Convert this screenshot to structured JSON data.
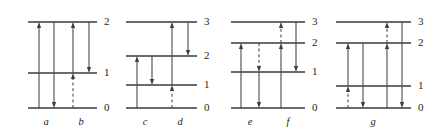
{
  "figure": {
    "type": "energy-level-diagram",
    "width": 438,
    "height": 140,
    "background_color": "#ffffff",
    "line_color": "#3a3a3a",
    "arrow_color": "#4a4a4a",
    "text_color": "#1c1c1c"
  },
  "panels": [
    {
      "id": "panel-1",
      "x_start": 28,
      "x_end": 97,
      "label_y": 123,
      "levels": [
        {
          "name": "2",
          "y": 22,
          "x_start": 28,
          "x_end": 97
        },
        {
          "name": "1",
          "y": 73,
          "x_start": 28,
          "x_end": 97
        },
        {
          "name": "0",
          "y": 108,
          "x_start": 28,
          "x_end": 97
        }
      ],
      "level_label_x": 104,
      "columns": [
        {
          "name": "a",
          "x": 46
        },
        {
          "name": "b",
          "x": 81
        }
      ],
      "arrows": [
        {
          "name": "arrow-up-0-to-2",
          "x": 39,
          "y_from": 108,
          "y_to": 22,
          "direction": "up",
          "style": "solid"
        },
        {
          "name": "arrow-down-2-to-0",
          "x": 54,
          "y_from": 22,
          "y_to": 108,
          "direction": "down",
          "style": "solid"
        },
        {
          "name": "arrow-up-0-to-1-dashed",
          "x": 73,
          "y_from": 108,
          "y_to": 73,
          "direction": "up",
          "style": "dashed"
        },
        {
          "name": "arrow-up-1-to-2",
          "x": 73,
          "y_from": 73,
          "y_to": 22,
          "direction": "up",
          "style": "solid"
        },
        {
          "name": "arrow-down-2-to-1",
          "x": 89,
          "y_from": 22,
          "y_to": 73,
          "direction": "down",
          "style": "solid"
        }
      ]
    },
    {
      "id": "panel-2",
      "x_start": 126,
      "x_end": 197,
      "label_y": 123,
      "levels": [
        {
          "name": "3",
          "y": 22,
          "x_start": 126,
          "x_end": 197
        },
        {
          "name": "2",
          "y": 56,
          "x_start": 126,
          "x_end": 197
        },
        {
          "name": "1",
          "y": 85,
          "x_start": 126,
          "x_end": 197
        },
        {
          "name": "0",
          "y": 108,
          "x_start": 126,
          "x_end": 197
        }
      ],
      "level_label_x": 204,
      "columns": [
        {
          "name": "c",
          "x": 145
        },
        {
          "name": "d",
          "x": 180
        }
      ],
      "arrows": [
        {
          "name": "arrow-up-0-to-2",
          "x": 137,
          "y_from": 108,
          "y_to": 56,
          "direction": "up",
          "style": "solid"
        },
        {
          "name": "arrow-down-2-to-1",
          "x": 152,
          "y_from": 56,
          "y_to": 85,
          "direction": "down",
          "style": "solid"
        },
        {
          "name": "arrow-up-0-to-1-dashed",
          "x": 172,
          "y_from": 108,
          "y_to": 85,
          "direction": "up",
          "style": "dashed"
        },
        {
          "name": "arrow-up-1-to-3",
          "x": 172,
          "y_from": 85,
          "y_to": 22,
          "direction": "up",
          "style": "solid"
        },
        {
          "name": "arrow-down-3-to-2",
          "x": 188,
          "y_from": 22,
          "y_to": 56,
          "direction": "down",
          "style": "solid"
        }
      ]
    },
    {
      "id": "panel-3",
      "x_start": 231,
      "x_end": 305,
      "label_y": 123,
      "levels": [
        {
          "name": "3",
          "y": 22,
          "x_start": 231,
          "x_end": 305
        },
        {
          "name": "2",
          "y": 43,
          "x_start": 231,
          "x_end": 305
        },
        {
          "name": "1",
          "y": 72,
          "x_start": 231,
          "x_end": 305
        },
        {
          "name": "0",
          "y": 108,
          "x_start": 231,
          "x_end": 305
        }
      ],
      "level_label_x": 312,
      "columns": [
        {
          "name": "e",
          "x": 250
        },
        {
          "name": "f",
          "x": 288
        }
      ],
      "arrows": [
        {
          "name": "arrow-up-1-to-2",
          "x": 241,
          "y_from": 108,
          "y_to": 43,
          "direction": "up",
          "style": "solid"
        },
        {
          "name": "arrow-down-2-to-1-dashed",
          "x": 259,
          "y_from": 43,
          "y_to": 72,
          "direction": "down",
          "style": "dashed"
        },
        {
          "name": "arrow-down-1-to-0",
          "x": 259,
          "y_from": 72,
          "y_to": 108,
          "direction": "down",
          "style": "solid"
        },
        {
          "name": "arrow-up-0-to-2",
          "x": 281,
          "y_from": 108,
          "y_to": 43,
          "direction": "up",
          "style": "solid"
        },
        {
          "name": "arrow-up-2-to-3-dashed",
          "x": 281,
          "y_from": 43,
          "y_to": 22,
          "direction": "up",
          "style": "dashed"
        },
        {
          "name": "arrow-down-3-to-1",
          "x": 296,
          "y_from": 22,
          "y_to": 72,
          "direction": "down",
          "style": "solid"
        }
      ]
    },
    {
      "id": "panel-4",
      "x_start": 336,
      "x_end": 411,
      "label_y": 123,
      "levels": [
        {
          "name": "3",
          "y": 22,
          "x_start": 336,
          "x_end": 411
        },
        {
          "name": "2",
          "y": 43,
          "x_start": 336,
          "x_end": 411
        },
        {
          "name": "1",
          "y": 86,
          "x_start": 336,
          "x_end": 411
        },
        {
          "name": "0",
          "y": 108,
          "x_start": 336,
          "x_end": 411
        }
      ],
      "level_label_x": 418,
      "columns": [
        {
          "name": "g",
          "x": 373
        }
      ],
      "arrows": [
        {
          "name": "arrow-up-0-to-1-dashed",
          "x": 348,
          "y_from": 108,
          "y_to": 86,
          "direction": "up",
          "style": "dashed"
        },
        {
          "name": "arrow-up-1-to-2",
          "x": 348,
          "y_from": 86,
          "y_to": 43,
          "direction": "up",
          "style": "solid"
        },
        {
          "name": "arrow-down-2-to-0",
          "x": 363,
          "y_from": 43,
          "y_to": 108,
          "direction": "down",
          "style": "solid"
        },
        {
          "name": "arrow-up-0-to-2",
          "x": 387,
          "y_from": 108,
          "y_to": 43,
          "direction": "up",
          "style": "solid"
        },
        {
          "name": "arrow-up-2-to-3-dashed",
          "x": 387,
          "y_from": 43,
          "y_to": 22,
          "direction": "up",
          "style": "dashed"
        },
        {
          "name": "arrow-down-3-to-0",
          "x": 402,
          "y_from": 22,
          "y_to": 108,
          "direction": "down",
          "style": "solid"
        }
      ]
    }
  ]
}
